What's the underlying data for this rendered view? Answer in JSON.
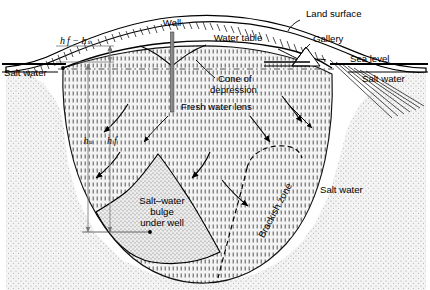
{
  "figure": {
    "type": "cross-section-diagram",
    "background_color": "#ffffff",
    "line_color": "#000000"
  },
  "labels": {
    "land_surface": "Land surface",
    "well": "Well",
    "water_table": "Water table",
    "gallery": "Gallery",
    "sea_level": "Sea level",
    "salt_water_left": "Salt water",
    "salt_water_right": "Salt water",
    "salt_water_body": "Salt water",
    "cone_of_depression_line1": "Cone of",
    "cone_of_depression_line2": "depression",
    "fresh_water_lens": "Fresh water lens",
    "brackish_zone": "Brackish zone",
    "bulge_line1": "Salt–water",
    "bulge_line2": "bulge",
    "bulge_line3": "under well"
  },
  "dimensions": {
    "hf_minus_hs": "h f − hₛ",
    "hf_minus_hs_plain": "hf - hs",
    "hs": "hₛ",
    "hf": "h f"
  },
  "colors": {
    "fresh_water_lens_fill": "#f2f2f2",
    "salt_water_fill": "#ededed",
    "bulge_fill": "#e2e2e2",
    "stroke": "#000000",
    "well_casing": "#9a9a9a",
    "dimension_line": "#8c8c8c"
  },
  "regions": [
    {
      "name": "fresh-water-lens",
      "pattern": "vertical dashed hatch",
      "label": "Fresh water lens"
    },
    {
      "name": "salt-water",
      "pattern": "fine stipple",
      "label": "Salt water"
    },
    {
      "name": "salt-water-bulge",
      "pattern": "dense stipple",
      "label": "Salt-water bulge under well"
    },
    {
      "name": "brackish-zone",
      "pattern": "dashed boundary",
      "label": "Brackish zone"
    }
  ],
  "features": {
    "well_count": 1,
    "gallery_count": 1,
    "flow_arrow_count": 6,
    "leader_line_count": 6
  }
}
